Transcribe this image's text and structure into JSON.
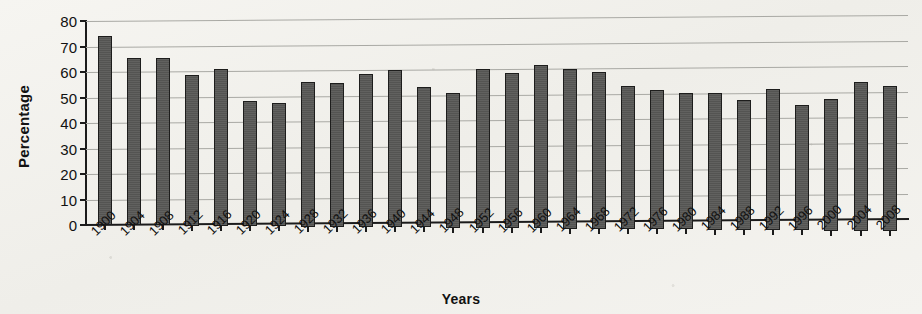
{
  "chart_data": {
    "type": "bar",
    "title": "",
    "xlabel": "Years",
    "ylabel": "Percentage",
    "ylim": [
      0,
      80
    ],
    "ytick_step": 10,
    "yticks": [
      0,
      10,
      20,
      30,
      40,
      50,
      60,
      70,
      80
    ],
    "grid": true,
    "legend": null,
    "bar_color": "#585856",
    "bar_edge_color": "#1d1d1c",
    "background_color": "#f3f2ee",
    "categories": [
      "1900",
      "1904",
      "1908",
      "1912",
      "1916",
      "1920",
      "1924",
      "1928",
      "1932",
      "1936",
      "1940",
      "1944",
      "1948",
      "1952",
      "1956",
      "1960",
      "1964",
      "1968",
      "1972",
      "1976",
      "1980",
      "1984",
      "1988",
      "1992",
      "1996",
      "2000",
      "2004",
      "2008"
    ],
    "values": [
      74,
      65.5,
      65.5,
      59,
      61.5,
      49,
      48.5,
      56.5,
      56.5,
      60,
      61.5,
      55,
      53,
      62.5,
      61,
      64,
      62.5,
      61.5,
      56,
      54.5,
      53.5,
      53.5,
      51,
      55.5,
      49,
      51.5,
      58.5,
      57
    ]
  }
}
